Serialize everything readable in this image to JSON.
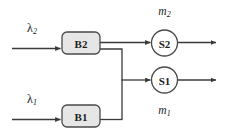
{
  "diagram": {
    "type": "queueing-network-block-diagram",
    "canvas": {
      "width": 232,
      "height": 138,
      "background": "#ffffff"
    },
    "colors": {
      "line": "#3a3a3a",
      "box_fill": "#e6e6e6",
      "box_stroke": "#4a4a4a",
      "circle_fill": "#ffffff",
      "circle_stroke": "#4a4a4a",
      "text": "#1c1c1c"
    },
    "nodes": {
      "buffer_2": {
        "label": "B2",
        "shape": "rounded-rect",
        "x": 62,
        "y": 32,
        "width": 38,
        "height": 22
      },
      "buffer_1": {
        "label": "B1",
        "shape": "rounded-rect",
        "x": 62,
        "y": 105,
        "width": 38,
        "height": 22
      },
      "server_2": {
        "label": "S2",
        "shape": "circle",
        "cx": 164.5,
        "cy": 43,
        "r": 13
      },
      "server_1": {
        "label": "S1",
        "shape": "circle",
        "cx": 164.5,
        "cy": 80,
        "r": 13
      }
    },
    "labels": {
      "arrival_rate_2": {
        "base": "λ",
        "sub": "2",
        "x": 32,
        "y": 28
      },
      "arrival_rate_1": {
        "base": "λ",
        "sub": "1",
        "x": 32,
        "y": 99
      },
      "service_rate_2": {
        "base": "m",
        "sub": "2",
        "x": 164.5,
        "y": 11
      },
      "service_rate_1": {
        "base": "m",
        "sub": "1",
        "x": 164.5,
        "y": 110
      }
    },
    "edges": [
      {
        "name": "lambda2-to-B2",
        "from": "arrival_2",
        "to": "buffer_2",
        "arrow": true
      },
      {
        "name": "B2-to-S2",
        "from": "buffer_2",
        "to": "server_2",
        "arrow": true
      },
      {
        "name": "B2-to-junction",
        "from": "buffer_2",
        "to": "junction",
        "arrow": false
      },
      {
        "name": "lambda1-to-B1",
        "from": "arrival_1",
        "to": "buffer_1",
        "arrow": true
      },
      {
        "name": "B1-to-junction",
        "from": "buffer_1",
        "to": "junction",
        "arrow": false
      },
      {
        "name": "junction-to-S1",
        "from": "junction",
        "to": "server_1",
        "arrow": true
      },
      {
        "name": "S2-departure",
        "from": "server_2",
        "to": "exit",
        "arrow": true
      },
      {
        "name": "S1-departure",
        "from": "server_1",
        "to": "exit",
        "arrow": true
      }
    ]
  }
}
